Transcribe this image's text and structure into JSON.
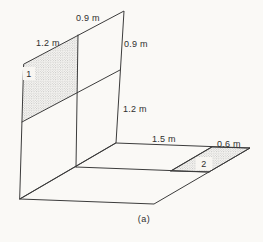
{
  "figure": {
    "caption": "(a)",
    "labels": {
      "wall_top": "0.9 m",
      "wall_top_left": "1.2 m",
      "wall_right_upper": "0.9 m",
      "wall_right_lower": "1.2 m",
      "floor_back": "1.5 m",
      "floor_back_right": "0.6 m",
      "region_1": "1",
      "region_2": "2"
    }
  },
  "colors": {
    "paper": "#f8f6f2",
    "line": "#3c3c3c",
    "text": "#2e2e2e",
    "stipple": "#8e8e8e"
  }
}
